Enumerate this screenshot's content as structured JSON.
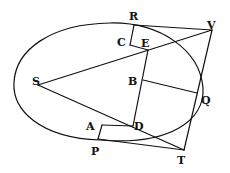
{
  "diagram": {
    "type": "geometric-figure",
    "ink_color": "#111111",
    "background": "#ffffff",
    "points": {
      "R": {
        "label": "R"
      },
      "V": {
        "label": "V"
      },
      "C": {
        "label": "C"
      },
      "E": {
        "label": "E"
      },
      "S": {
        "label": "S"
      },
      "B": {
        "label": "B"
      },
      "Q": {
        "label": "Q"
      },
      "A": {
        "label": "A"
      },
      "D": {
        "label": "D"
      },
      "P": {
        "label": "P"
      },
      "T": {
        "label": "T"
      }
    },
    "segments": [
      "RV",
      "RC",
      "CE",
      "SV",
      "ST",
      "ED",
      "BQ",
      "VT",
      "AD",
      "AP",
      "PT"
    ],
    "curves": [
      "ellipse-orbit"
    ]
  }
}
